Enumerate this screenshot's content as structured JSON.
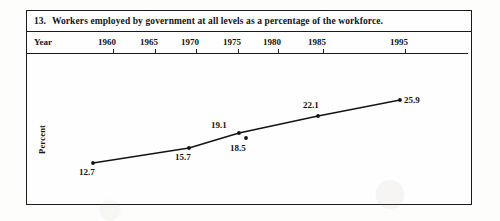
{
  "figure": {
    "number": "13.",
    "title": "Workers employed by government at all levels as a percentage of the workforce.",
    "axis_row_label": "Year",
    "y_axis_title": "Percent"
  },
  "chart_data": {
    "type": "line",
    "title": "Workers employed by government at all levels as a percentage of the workforce.",
    "xlabel": "Year",
    "ylabel": "Percent",
    "grid": false,
    "legend": null,
    "xtick_labels": [
      "1960",
      "1965",
      "1970",
      "1975",
      "1980",
      "1985",
      "1995"
    ],
    "xlim": [
      1960,
      1995
    ],
    "ylim": [
      12,
      27
    ],
    "x": [
      1960,
      1965,
      1970,
      1975,
      1985,
      1995
    ],
    "values": [
      12.7,
      15.7,
      19.1,
      18.5,
      22.1,
      25.9
    ],
    "point_labels": [
      "12.7",
      "15.7",
      "19.1",
      "18.5",
      "22.1",
      "25.9"
    ],
    "series": [
      {
        "name": "Government workers as percent of workforce",
        "points": [
          {
            "year": "1960",
            "value": 12.7,
            "label": "12.7",
            "px": 66,
            "py": 109,
            "label_x": 52,
            "label_y": 113,
            "on_line": true
          },
          {
            "year": "1965",
            "value": 15.7,
            "label": "15.7",
            "px": 162,
            "py": 94,
            "label_x": 148,
            "label_y": 98,
            "on_line": true
          },
          {
            "year": "1975",
            "value": 19.1,
            "label": "19.1",
            "px": 212,
            "py": 79,
            "label_x": 184,
            "label_y": 66,
            "on_line": true
          },
          {
            "year": "1975b",
            "value": 18.5,
            "label": "18.5",
            "px": 219,
            "py": 84,
            "label_x": 203,
            "label_y": 89,
            "on_line": false
          },
          {
            "year": "1985",
            "value": 22.1,
            "label": "22.1",
            "px": 291,
            "py": 62,
            "label_x": 276,
            "label_y": 46,
            "on_line": true
          },
          {
            "year": "1995",
            "value": 25.9,
            "label": "25.9",
            "px": 373,
            "py": 46,
            "label_x": 377,
            "label_y": 41,
            "on_line": true
          }
        ]
      }
    ]
  },
  "axis": {
    "ticks": [
      {
        "label": "1960",
        "x": 80
      },
      {
        "label": "1965",
        "x": 122
      },
      {
        "label": "1970",
        "x": 163
      },
      {
        "label": "1975",
        "x": 205
      },
      {
        "label": "1980",
        "x": 245
      },
      {
        "label": "1985",
        "x": 290
      },
      {
        "label": "1995",
        "x": 372
      }
    ]
  },
  "colors": {
    "ink": "#141414",
    "rule": "#1b1b1b",
    "paper": "#fefefe"
  }
}
